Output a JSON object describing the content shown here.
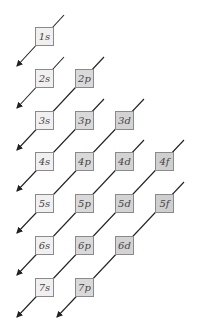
{
  "colors": {
    "s": "#f0f0f0",
    "p": "#d9d9d9",
    "d": "#d3d3d3",
    "f": "#cfcfcf",
    "line": "#222222"
  },
  "layout": {
    "col_x": [
      35,
      75,
      115,
      155
    ],
    "row_y": [
      27,
      69,
      111,
      152,
      194,
      236,
      278
    ]
  },
  "orbitals": [
    {
      "label": "1s",
      "row": 0,
      "col": 0,
      "type": "s"
    },
    {
      "label": "2s",
      "row": 1,
      "col": 0,
      "type": "s"
    },
    {
      "label": "2p",
      "row": 1,
      "col": 1,
      "type": "p"
    },
    {
      "label": "3s",
      "row": 2,
      "col": 0,
      "type": "s"
    },
    {
      "label": "3p",
      "row": 2,
      "col": 1,
      "type": "p"
    },
    {
      "label": "3d",
      "row": 2,
      "col": 2,
      "type": "d"
    },
    {
      "label": "4s",
      "row": 3,
      "col": 0,
      "type": "s"
    },
    {
      "label": "4p",
      "row": 3,
      "col": 1,
      "type": "p"
    },
    {
      "label": "4d",
      "row": 3,
      "col": 2,
      "type": "d"
    },
    {
      "label": "4f",
      "row": 3,
      "col": 3,
      "type": "f"
    },
    {
      "label": "5s",
      "row": 4,
      "col": 0,
      "type": "s"
    },
    {
      "label": "5p",
      "row": 4,
      "col": 1,
      "type": "p"
    },
    {
      "label": "5d",
      "row": 4,
      "col": 2,
      "type": "d"
    },
    {
      "label": "5f",
      "row": 4,
      "col": 3,
      "type": "f"
    },
    {
      "label": "6s",
      "row": 5,
      "col": 0,
      "type": "s"
    },
    {
      "label": "6p",
      "row": 5,
      "col": 1,
      "type": "p"
    },
    {
      "label": "6d",
      "row": 5,
      "col": 2,
      "type": "d"
    },
    {
      "label": "7s",
      "row": 6,
      "col": 0,
      "type": "s"
    },
    {
      "label": "7p",
      "row": 6,
      "col": 1,
      "type": "p"
    }
  ]
}
